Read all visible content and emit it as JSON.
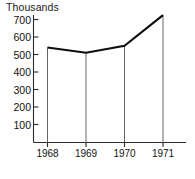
{
  "chart_data": {
    "type": "line",
    "title": "",
    "subtitle": "",
    "xlabel": "",
    "ylabel": "Thousands",
    "unit_label": "Thousands",
    "categories": [
      "1968",
      "1969",
      "1970",
      "1971"
    ],
    "x": [
      1968,
      1969,
      1970,
      1971
    ],
    "values": [
      540,
      510,
      550,
      725
    ],
    "series": [
      {
        "name": "",
        "values": [
          540,
          510,
          550,
          725
        ]
      }
    ],
    "ylim": [
      0,
      750
    ],
    "yticks": [
      100,
      200,
      300,
      400,
      500,
      600,
      700
    ],
    "ytick_labels": [
      "100",
      "200",
      "300",
      "400",
      "500",
      "600",
      "700"
    ],
    "xtick_labels": [
      "1968",
      "1969",
      "1970",
      "1971"
    ],
    "grid": false,
    "legend": false,
    "legend_position": "none",
    "drop_lines": true,
    "annotations": [],
    "colors": {
      "background": "#ffffff",
      "data_line": "#0d0d0d",
      "axis": "#2b2b2b",
      "drop_line": "#555555",
      "text": "#111111"
    }
  }
}
